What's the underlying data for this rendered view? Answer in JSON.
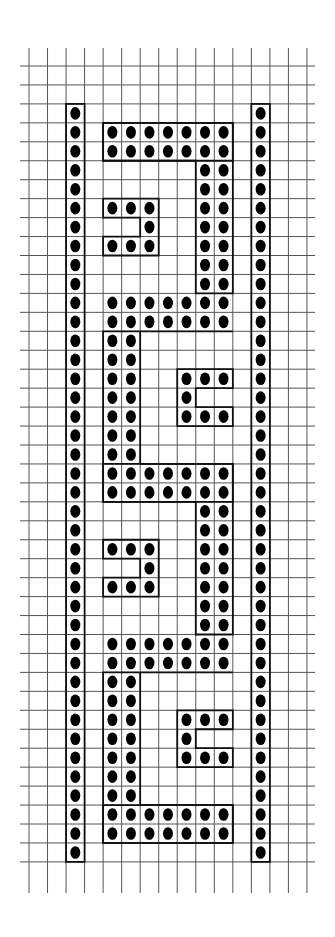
{
  "diagram": {
    "title": "",
    "type": "grid-bead-pattern",
    "colors": {
      "background": "#ffffff",
      "grid": "#555555",
      "outline": "#111111",
      "dot": "#000000"
    },
    "grid": {
      "columns": 15,
      "rows": 42,
      "origin_x": 29,
      "origin_y": 66,
      "cell_width": 18.53,
      "cell_height": 18.95,
      "hline_x_start": 20,
      "hline_x_end": 315,
      "vline_y_start": 48,
      "vline_y_end": 893
    },
    "bars": [
      {
        "name": "left-border-bar",
        "col": 2,
        "row_start": 2,
        "row_end": 41
      },
      {
        "name": "right-border-bar",
        "col": 12,
        "row_start": 2,
        "row_end": 41
      }
    ],
    "meander": {
      "col_start": 4,
      "col_end": 10,
      "blocks": [
        {
          "type": "full",
          "rows": [
            3,
            4
          ]
        },
        {
          "type": "vertical",
          "side": "right",
          "cols": [
            9,
            10
          ],
          "row_start": 5,
          "row_end": 11
        },
        {
          "type": "hook",
          "opens": "left",
          "cols": [
            4,
            5,
            6
          ],
          "row_start": 7
        },
        {
          "type": "full",
          "rows": [
            12,
            13
          ]
        },
        {
          "type": "vertical",
          "side": "left",
          "cols": [
            4,
            5
          ],
          "row_start": 14,
          "row_end": 20
        },
        {
          "type": "hook",
          "opens": "right",
          "cols": [
            8,
            9,
            10
          ],
          "row_start": 16
        },
        {
          "type": "full",
          "rows": [
            21,
            22
          ]
        },
        {
          "type": "vertical",
          "side": "right",
          "cols": [
            9,
            10
          ],
          "row_start": 23,
          "row_end": 29
        },
        {
          "type": "hook",
          "opens": "left",
          "cols": [
            4,
            5,
            6
          ],
          "row_start": 25
        },
        {
          "type": "full",
          "rows": [
            30,
            31
          ]
        },
        {
          "type": "vertical",
          "side": "left",
          "cols": [
            4,
            5
          ],
          "row_start": 32,
          "row_end": 38
        },
        {
          "type": "hook",
          "opens": "right",
          "cols": [
            8,
            9,
            10
          ],
          "row_start": 34
        },
        {
          "type": "full",
          "rows": [
            39,
            40
          ]
        }
      ]
    }
  }
}
